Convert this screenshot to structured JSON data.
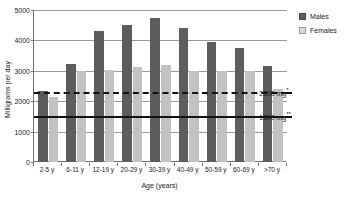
{
  "chart_data": {
    "type": "bar",
    "title": "",
    "xlabel": "Age (years)",
    "ylabel": "Milligrams per day",
    "categories": [
      "2-5 y",
      "6-11 y",
      "12-19 y",
      "20-29 y",
      "30-39 y",
      "40-49 y",
      "50-59 y",
      "60-69 y",
      ">70 y"
    ],
    "series": [
      {
        "name": "Males",
        "color": "#5d5d5d",
        "values": [
          2350,
          3230,
          4300,
          4500,
          4750,
          4400,
          3950,
          3750,
          3150
        ]
      },
      {
        "name": "Females",
        "color": "#c2c2c2",
        "values": [
          2150,
          2980,
          3020,
          3130,
          3200,
          2980,
          2980,
          2980,
          2400
        ]
      }
    ],
    "ylim": [
      0,
      5000
    ],
    "yticks": [
      0,
      1000,
      2000,
      3000,
      4000,
      5000
    ],
    "ytick_labels": [
      "0",
      "1000",
      "2000",
      "3000",
      "4000",
      "5000"
    ],
    "grid": "horizontal",
    "legend_position": "right-top",
    "reference_lines": [
      {
        "name": "upper-limit-line",
        "value": 2300,
        "label": "2300 mg",
        "marker": "*",
        "style": "dashed"
      },
      {
        "name": "lower-limit-line",
        "value": 1500,
        "label": "1500 mg",
        "marker": "**",
        "style": "solid"
      }
    ]
  },
  "legend": {
    "items": [
      {
        "label": "Males"
      },
      {
        "label": "Females"
      }
    ]
  },
  "caption": {
    "cutoff_text": ""
  }
}
